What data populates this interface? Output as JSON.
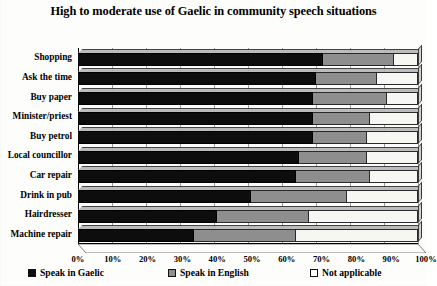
{
  "chart_data": {
    "type": "bar",
    "orientation": "horizontal",
    "stacked": true,
    "title": "High to moderate use of Gaelic in community speech situations",
    "xlabel": "",
    "ylabel": "",
    "xlim": [
      0,
      100
    ],
    "xticks": [
      "0%",
      "10%",
      "20%",
      "30%",
      "40%",
      "50%",
      "60%",
      "70%",
      "80%",
      "90%",
      "100%"
    ],
    "xtick_values": [
      0,
      10,
      20,
      30,
      40,
      50,
      60,
      70,
      80,
      90,
      100
    ],
    "grid": true,
    "legend_position": "bottom",
    "categories": [
      "Shopping",
      "Ask the time",
      "Buy paper",
      "Minister/priest",
      "Buy petrol",
      "Local councillor",
      "Car repair",
      "Drink in pub",
      "Hairdresser",
      "Machine repair"
    ],
    "series": [
      {
        "name": "Speak in Gaelic",
        "color": "#0d0d0d",
        "values": [
          72,
          70,
          69,
          69,
          69,
          65,
          64,
          51,
          41,
          34
        ]
      },
      {
        "name": "Speak in English",
        "color": "#8e8e8e",
        "values": [
          21,
          18,
          22,
          17,
          16,
          20,
          22,
          28,
          27,
          30
        ]
      },
      {
        "name": "Not applicable",
        "color": "#ffffff",
        "values": [
          7,
          12,
          9,
          14,
          15,
          15,
          14,
          21,
          32,
          36
        ]
      }
    ]
  },
  "legend": {
    "items": [
      {
        "label": "Speak in Gaelic",
        "swatch": "black-square-swatch"
      },
      {
        "label": "Speak in English",
        "swatch": "gray-square-swatch"
      },
      {
        "label": "Not applicable",
        "swatch": "white-square-swatch"
      }
    ]
  }
}
